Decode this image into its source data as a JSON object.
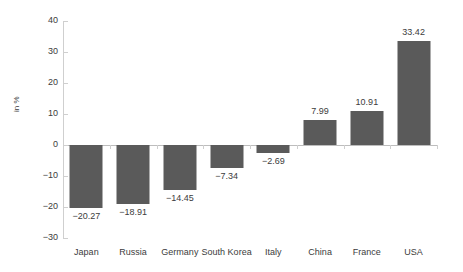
{
  "chart_data": {
    "type": "bar",
    "title": "",
    "subtitle": "",
    "xlabel": "",
    "ylabel": "in %",
    "categories": [
      "Japan",
      "Russia",
      "Germany",
      "South Korea",
      "Italy",
      "China",
      "France",
      "USA"
    ],
    "values": [
      -20.27,
      -18.91,
      -14.45,
      -7.34,
      -2.69,
      7.99,
      10.91,
      33.42
    ],
    "value_labels": [
      "−20.27",
      "−18.91",
      "−14.45",
      "−7.34",
      "−2.69",
      "7.99",
      "10.91",
      "33.42"
    ],
    "ylim": [
      -30,
      40
    ],
    "yticks": [
      40,
      30,
      20,
      10,
      0,
      -10,
      -20,
      -30
    ],
    "ytick_labels": [
      "40",
      "30",
      "20",
      "10",
      "0",
      "−10",
      "−20",
      "−30"
    ],
    "grid": false,
    "legend": "none",
    "bar_color": "#5a5a5a",
    "axis_color": "#cfcfcf",
    "baseline_color": "#bdbdbd",
    "text_color": "#3c3c3c"
  }
}
